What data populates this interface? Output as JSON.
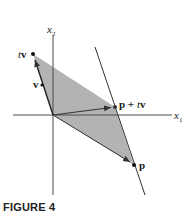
{
  "figure": {
    "caption": "FIGURE 4",
    "axes": {
      "x_label": "x",
      "x_sub": "1",
      "y_label": "x",
      "y_sub": "2"
    },
    "labels": {
      "tv_t": "t",
      "tv_v": "v",
      "v": "v",
      "ptv_p": "p + ",
      "ptv_t": "t",
      "ptv_v": "v",
      "p": "p"
    },
    "colors": {
      "fill": "#b3b3b3",
      "line": "#333333",
      "axis": "#4a4a4a"
    }
  }
}
